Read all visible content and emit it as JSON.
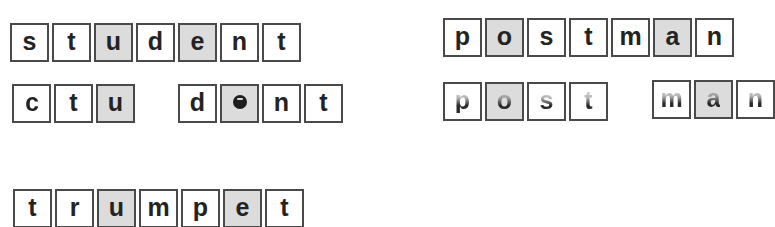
{
  "colors": {
    "tile_border": "#4a4a4a",
    "tile_fill": "#ffffff",
    "tile_shaded_fill": "#dcdcdc",
    "letter": "#232323"
  },
  "words": {
    "student": {
      "intact": [
        "s",
        "t",
        "u",
        "d",
        "e",
        "n",
        "t"
      ],
      "shaded_indices": [
        2,
        4
      ],
      "split": {
        "part1": [
          "ɔ",
          "t",
          "u"
        ],
        "part2": [
          "d",
          "e",
          "n",
          "t"
        ],
        "notes": "s shown reversed; e shown as filled blob"
      }
    },
    "postman": {
      "intact": [
        "p",
        "o",
        "s",
        "t",
        "m",
        "a",
        "n"
      ],
      "shaded_indices": [
        1,
        5
      ],
      "split": {
        "part1": [
          "p",
          "o",
          "s",
          "t"
        ],
        "part2": [
          "m",
          "a",
          "n"
        ],
        "notes": "letters partially faded / upper halves obscured"
      }
    },
    "trumpet": {
      "intact": [
        "t",
        "r",
        "u",
        "m",
        "p",
        "e",
        "t"
      ],
      "shaded_indices": [
        2,
        5
      ]
    }
  }
}
